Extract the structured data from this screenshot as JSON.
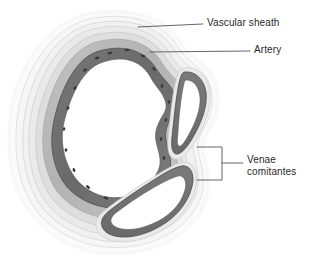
{
  "figure": {
    "type": "anatomical-cross-section",
    "background_color": "#ffffff"
  },
  "labels": [
    {
      "id": "vascular-sheath",
      "text": "Vascular sheath",
      "leader": "straight-line",
      "points_to": "outer-sheath-boundary"
    },
    {
      "id": "artery",
      "text": "Artery",
      "leader": "straight-line",
      "points_to": "artery-wall"
    },
    {
      "id": "venae-comitantes",
      "text": "Venae\ncomitantes",
      "line1": "Venae",
      "line2": "comitantes",
      "leader": "bracket",
      "points_to": "two-accompanying-veins"
    }
  ],
  "structures": [
    {
      "id": "vascular-sheath",
      "name": "Vascular sheath",
      "description": "Faint translucent outer envelope enclosing artery and both veins",
      "color": "#f2f2f2",
      "stroke": "#d8d8d8"
    },
    {
      "id": "artery",
      "name": "Artery",
      "description": "Large central vessel with layered wall and irregular white lumen",
      "layers": [
        {
          "name": "adventitia",
          "color": "#ececec"
        },
        {
          "name": "connective-tissue",
          "color": "#d6d6d6"
        },
        {
          "name": "tunica-media",
          "color": "#b8b8b8"
        },
        {
          "name": "tunica-intima",
          "color": "#6f6f6f"
        },
        {
          "name": "lumen",
          "color": "#ffffff"
        }
      ],
      "nuclei_color": "#3a3a3a"
    },
    {
      "id": "vena-comitans-upper",
      "name": "Vena comitans (upper)",
      "description": "Teardrop-shaped thin-walled vein on the upper right",
      "wall_color": "#6f6f6f",
      "lumen_color": "#ffffff"
    },
    {
      "id": "vena-comitans-lower",
      "name": "Vena comitans (lower)",
      "description": "Crescent-shaped thin-walled vein at the lower right",
      "wall_color": "#6f6f6f",
      "lumen_color": "#ffffff"
    }
  ],
  "leader_lines": {
    "color": "#555555",
    "width": 0.9
  }
}
